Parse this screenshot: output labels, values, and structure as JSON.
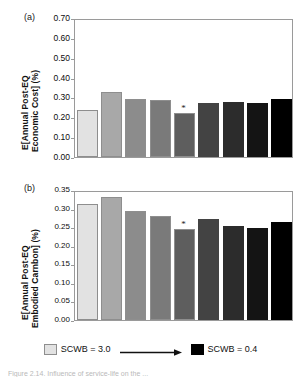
{
  "figure": {
    "caption": "Figure 2.14. Influence of service-life on the ...",
    "panel_a_letter": "(a)",
    "panel_b_letter": "(b)"
  },
  "legend": {
    "light_label": "SCWB = 3.0",
    "dark_label": "SCWB = 0.4",
    "light_color": "#e2e2e2",
    "dark_color": "#000000",
    "arrow_name": "gradient-arrow"
  },
  "chart_data": [
    {
      "type": "bar",
      "panel": "(a)",
      "title": "",
      "xlabel": "",
      "ylabel": "E[Annual Post-EQ Economic Cost] (%)",
      "ylabel_line1": "E[Annual Post-EQ",
      "ylabel_line2": "Economic Cost] (%)",
      "ylim": [
        0.0,
        0.7
      ],
      "yticks": [
        0.0,
        0.1,
        0.2,
        0.3,
        0.4,
        0.5,
        0.6,
        0.7
      ],
      "ytick_labels": [
        "0.00",
        "0.10",
        "0.20",
        "0.30",
        "0.40",
        "0.50",
        "0.60",
        "0.70"
      ],
      "grid": false,
      "legend_position": "below-figure",
      "categories": [
        "1",
        "2",
        "3",
        "4",
        "5",
        "6",
        "7",
        "8",
        "9"
      ],
      "values": [
        0.235,
        0.325,
        0.29,
        0.288,
        0.22,
        0.272,
        0.277,
        0.27,
        0.29
      ],
      "bar_colors": [
        "#e2e2e2",
        "#a8a8a8",
        "#8c8c8c",
        "#7a7a7a",
        "#5e5e5e",
        "#434343",
        "#2c2c2c",
        "#141414",
        "#000000"
      ],
      "annotations": [
        {
          "label": "*",
          "category_index": 4
        }
      ]
    },
    {
      "type": "bar",
      "panel": "(b)",
      "title": "",
      "xlabel": "",
      "ylabel": "E[Annual Post-EQ Embodied Carnbon] (%)",
      "ylabel_line1": "E[Annual Post-EQ",
      "ylabel_line2": "Embodied Carnbon] (%)",
      "ylim": [
        0.0,
        0.35
      ],
      "yticks": [
        0.0,
        0.05,
        0.1,
        0.15,
        0.2,
        0.25,
        0.3,
        0.35
      ],
      "ytick_labels": [
        "0.00",
        "0.05",
        "0.10",
        "0.15",
        "0.20",
        "0.25",
        "0.30",
        "0.35"
      ],
      "grid": false,
      "legend_position": "below-figure",
      "categories": [
        "1",
        "2",
        "3",
        "4",
        "5",
        "6",
        "7",
        "8",
        "9"
      ],
      "values": [
        0.312,
        0.33,
        0.293,
        0.281,
        0.245,
        0.272,
        0.253,
        0.248,
        0.263
      ],
      "bar_colors": [
        "#e2e2e2",
        "#a8a8a8",
        "#8c8c8c",
        "#7a7a7a",
        "#5e5e5e",
        "#434343",
        "#2c2c2c",
        "#141414",
        "#000000"
      ],
      "annotations": [
        {
          "label": "*",
          "category_index": 4
        }
      ]
    }
  ]
}
